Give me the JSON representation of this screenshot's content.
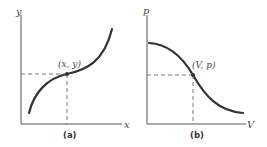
{
  "panels": [
    {
      "caption": "(a)",
      "x_axis_label": "x",
      "y_axis_label": "y",
      "point_label": "(x, y)",
      "curve": "increasing S-shaped (cubic-like) curve"
    },
    {
      "caption": "(b)",
      "x_axis_label": "V",
      "y_axis_label": "p",
      "point_label": "(V, p)",
      "curve": "decreasing sigmoid curve"
    }
  ],
  "colors": {
    "curve": "#333333",
    "axis": "#555555",
    "background": "#ffffff"
  }
}
